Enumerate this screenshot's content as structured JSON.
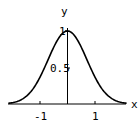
{
  "chart_data": {
    "type": "line",
    "title": "",
    "xlabel": "x",
    "ylabel": "y",
    "xlim": [
      -2.15,
      2.15
    ],
    "ylim": [
      0,
      1
    ],
    "grid": false,
    "legend": null,
    "x_ticks": [
      {
        "value": -1,
        "label": "-1"
      },
      {
        "value": 1,
        "label": "1"
      }
    ],
    "y_ticks": [
      {
        "value": 0.5,
        "label": "0.5"
      },
      {
        "value": 1,
        "label": "1"
      }
    ],
    "series": [
      {
        "name": "exp(-x^2)",
        "x": [
          -2.15,
          -2.0,
          -1.75,
          -1.5,
          -1.25,
          -1.0,
          -0.75,
          -0.5,
          -0.25,
          0,
          0.25,
          0.5,
          0.75,
          1.0,
          1.25,
          1.5,
          1.75,
          2.0,
          2.15
        ],
        "values": [
          0.01,
          0.018,
          0.047,
          0.105,
          0.21,
          0.368,
          0.57,
          0.779,
          0.939,
          1.0,
          0.939,
          0.779,
          0.57,
          0.368,
          0.21,
          0.105,
          0.047,
          0.018,
          0.01
        ]
      }
    ]
  },
  "labels": {
    "x_axis": "x",
    "y_axis": "y",
    "tick_neg1": "-1",
    "tick_pos1": "1",
    "tick_half": "0.5",
    "tick_one": "1"
  }
}
